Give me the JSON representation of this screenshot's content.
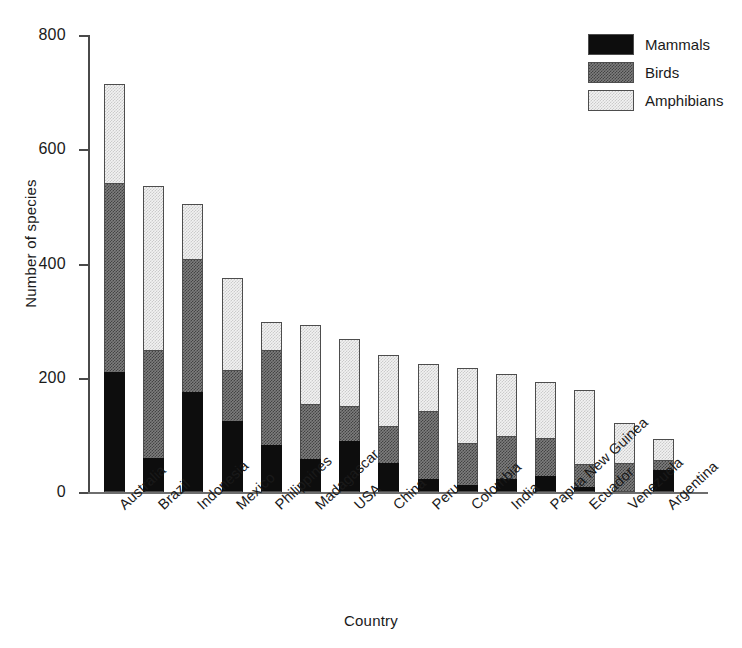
{
  "chart_data": {
    "type": "bar",
    "subtype": "stacked-vertical",
    "title": "",
    "xlabel": "Country",
    "ylabel": "Number of species",
    "ylim": [
      0,
      800
    ],
    "yticks": [
      0,
      200,
      400,
      600,
      800
    ],
    "grid": false,
    "legend_position": "top-right",
    "categories": [
      "Australia",
      "Brazil",
      "Indonesia",
      "Mexico",
      "Philippines",
      "Madagascar",
      "USA",
      "China",
      "Peru",
      "Colombia",
      "India",
      "Papua New Guinea",
      "Ecuador",
      "Venezuela",
      "Argentina"
    ],
    "series": [
      {
        "name": "Mammals",
        "color": "#0d0d0d",
        "values": [
          210,
          60,
          175,
          125,
          82,
          58,
          90,
          50,
          22,
          12,
          22,
          28,
          8,
          0,
          38
        ]
      },
      {
        "name": "Birds",
        "color": "#7d7d7d",
        "values": [
          332,
          190,
          235,
          90,
          168,
          98,
          62,
          68,
          122,
          76,
          78,
          68,
          42,
          50,
          20
        ]
      },
      {
        "name": "Amphibians",
        "color": "#f2f2f2",
        "values": [
          176,
          290,
          97,
          164,
          52,
          140,
          120,
          126,
          83,
          132,
          110,
          100,
          132,
          72,
          38
        ]
      }
    ],
    "totals": [
      718,
      540,
      507,
      379,
      302,
      296,
      272,
      244,
      227,
      220,
      210,
      196,
      182,
      122,
      96
    ]
  },
  "axes": {
    "y_tick_labels": [
      "800",
      "600",
      "400",
      "200",
      "0"
    ],
    "y_axis_title": "Number of species",
    "x_axis_title": "Country"
  },
  "legend": {
    "items": [
      {
        "label": "Mammals",
        "swatch": "black-solid-swatch"
      },
      {
        "label": "Birds",
        "swatch": "dark-gray-hatched-swatch"
      },
      {
        "label": "Amphibians",
        "swatch": "light-gray-hatched-swatch"
      }
    ]
  }
}
